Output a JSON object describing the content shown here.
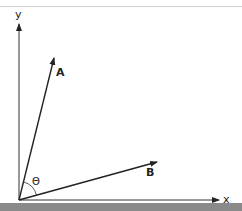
{
  "diagram": {
    "axes": {
      "x_label": "x",
      "y_label": "y"
    },
    "vectors": [
      {
        "name": "A",
        "label": "A"
      },
      {
        "name": "B",
        "label": "B"
      }
    ],
    "angle_label": "Θ",
    "colors": {
      "line": "#222222",
      "top_rule": "#cfcfcf",
      "bottom_band": "#8a8a8a"
    }
  }
}
